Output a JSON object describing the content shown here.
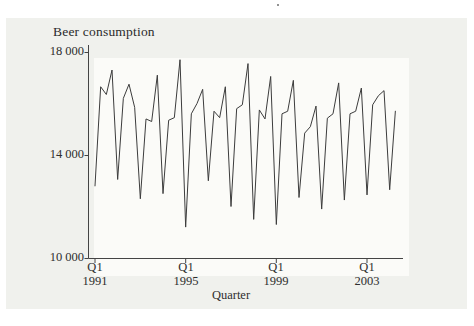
{
  "figure": {
    "title": "Beer consumption",
    "xlabel": "Quarter"
  },
  "chart_data": {
    "type": "line",
    "title": "Beer consumption",
    "xlabel": "Quarter",
    "ylabel": "",
    "frequency": "quarterly",
    "x_start": "1991 Q1",
    "x_end": "2004 Q2",
    "ylim": [
      10000,
      18000
    ],
    "grid": false,
    "legend": "none",
    "line_color": "#3c3c3c",
    "axis_color": "#444444",
    "y_ticks": [
      {
        "label": "18 000",
        "value": 18000
      },
      {
        "label": "14 000",
        "value": 14000
      },
      {
        "label": "10 000",
        "value": 10000
      }
    ],
    "x_ticks": [
      {
        "label_top": "Q1",
        "label_bottom": "1991",
        "index": 0
      },
      {
        "label_top": "Q1",
        "label_bottom": "1995",
        "index": 16
      },
      {
        "label_top": "Q1",
        "label_bottom": "1999",
        "index": 32
      },
      {
        "label_top": "Q1",
        "label_bottom": "2003",
        "index": 48
      }
    ],
    "x": [
      "1991Q1",
      "1991Q2",
      "1991Q3",
      "1991Q4",
      "1992Q1",
      "1992Q2",
      "1992Q3",
      "1992Q4",
      "1993Q1",
      "1993Q2",
      "1993Q3",
      "1993Q4",
      "1994Q1",
      "1994Q2",
      "1994Q3",
      "1994Q4",
      "1995Q1",
      "1995Q2",
      "1995Q3",
      "1995Q4",
      "1996Q1",
      "1996Q2",
      "1996Q3",
      "1996Q4",
      "1997Q1",
      "1997Q2",
      "1997Q3",
      "1997Q4",
      "1998Q1",
      "1998Q2",
      "1998Q3",
      "1998Q4",
      "1999Q1",
      "1999Q2",
      "1999Q3",
      "1999Q4",
      "2000Q1",
      "2000Q2",
      "2000Q3",
      "2000Q4",
      "2001Q1",
      "2001Q2",
      "2001Q3",
      "2001Q4",
      "2002Q1",
      "2002Q2",
      "2002Q3",
      "2002Q4",
      "2003Q1",
      "2003Q2",
      "2003Q3",
      "2003Q4",
      "2004Q1",
      "2004Q2"
    ],
    "series": [
      {
        "name": "Beer consumption",
        "values": [
          12800,
          16650,
          16350,
          17300,
          13050,
          16200,
          16750,
          15850,
          12300,
          15400,
          15300,
          17100,
          12500,
          15350,
          15450,
          17700,
          11200,
          15600,
          16000,
          16550,
          13000,
          15700,
          15450,
          16650,
          12000,
          15800,
          15950,
          17550,
          11500,
          15750,
          15400,
          17050,
          11300,
          15600,
          15700,
          16900,
          12350,
          14850,
          15100,
          15900,
          11900,
          15430,
          15600,
          16800,
          12250,
          15600,
          15700,
          16600,
          12450,
          15950,
          16300,
          16500,
          12650,
          15700
        ]
      }
    ]
  }
}
